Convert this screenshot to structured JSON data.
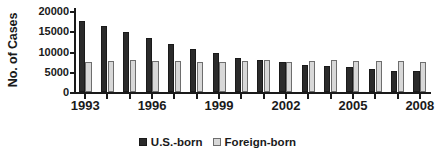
{
  "chart_data": {
    "type": "bar",
    "title": "",
    "xlabel": "",
    "ylabel": "No. of Cases",
    "ylim": [
      0,
      20000
    ],
    "ytick_values": [
      0,
      5000,
      10000,
      15000,
      20000
    ],
    "ytick_labels": [
      "0",
      "5000",
      "10000",
      "15000",
      "20000"
    ],
    "grid": false,
    "legend_position": "bottom-center",
    "categories": [
      "1993",
      "1994",
      "1995",
      "1996",
      "1997",
      "1998",
      "1999",
      "2000",
      "2001",
      "2002",
      "2003",
      "2004",
      "2005",
      "2006",
      "2007",
      "2008"
    ],
    "xtick_labels": [
      "1993",
      "1996",
      "1999",
      "2002",
      "2005",
      "2008"
    ],
    "xtick_categories": [
      "1993",
      "1996",
      "1999",
      "2002",
      "2005",
      "2008"
    ],
    "series": [
      {
        "name": "U.S.-born",
        "color": "#2b2b2b",
        "values": [
          17500,
          16200,
          14700,
          13300,
          11900,
          10600,
          9700,
          8500,
          7800,
          7300,
          6700,
          6500,
          6100,
          5700,
          5300,
          5100
        ]
      },
      {
        "name": "Foreign-born",
        "color": "#d8d8d8",
        "values": [
          7400,
          7700,
          7900,
          7600,
          7600,
          7400,
          7300,
          7600,
          7800,
          7300,
          7700,
          7800,
          7600,
          7600,
          7600,
          7300
        ]
      }
    ]
  },
  "legend": {
    "items": [
      {
        "label": "U.S.-born",
        "swatch": "dark-square-icon"
      },
      {
        "label": "Foreign-born",
        "swatch": "light-square-icon"
      }
    ]
  }
}
